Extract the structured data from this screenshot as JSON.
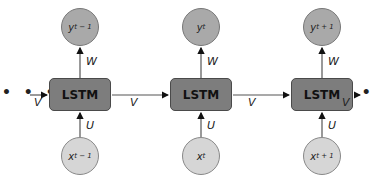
{
  "diagram": {
    "cells": [
      {
        "label": "LSTM",
        "output": {
          "var": "y",
          "sub": "t − 1"
        },
        "input": {
          "var": "x",
          "sub": "t − 1"
        }
      },
      {
        "label": "LSTM",
        "output": {
          "var": "y",
          "sub": "t"
        },
        "input": {
          "var": "x",
          "sub": "t"
        }
      },
      {
        "label": "LSTM",
        "output": {
          "var": "y",
          "sub": "t + 1"
        },
        "input": {
          "var": "x",
          "sub": "t + 1"
        }
      }
    ],
    "weights": {
      "output": "W",
      "input": "U",
      "recurrent": "V"
    },
    "ellipsis": "• • •",
    "colors": {
      "cell": "#7d7d7d",
      "output_node": "#a9a9a9",
      "input_node": "#d6d6d6"
    }
  }
}
